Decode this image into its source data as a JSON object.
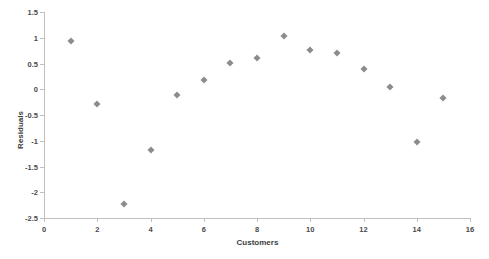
{
  "chart_data": {
    "type": "scatter",
    "title": "",
    "xlabel": "Customers",
    "ylabel": "Residuals",
    "xlim": [
      0,
      16
    ],
    "ylim": [
      -2.5,
      1.5
    ],
    "xticks": [
      "0",
      "2",
      "4",
      "6",
      "8",
      "10",
      "12",
      "14",
      "16"
    ],
    "yticks": [
      "1.5",
      "1",
      "0.5",
      "0",
      "-0.5",
      "-1",
      "-1.5",
      "-2",
      "-2.5"
    ],
    "grid": false,
    "legend": false,
    "marker_color": "#8c8c8c",
    "marker_shape": "diamond",
    "x": [
      1,
      2,
      3,
      4,
      5,
      6,
      7,
      8,
      9,
      10,
      11,
      12,
      13,
      14,
      15
    ],
    "y": [
      0.94,
      -0.28,
      -2.23,
      -1.18,
      -0.12,
      0.17,
      0.51,
      0.61,
      1.04,
      0.76,
      0.71,
      0.39,
      0.04,
      -1.02,
      -0.17
    ],
    "series": [
      {
        "name": "Residuals",
        "points": [
          {
            "x": 1,
            "y": 0.94
          },
          {
            "x": 2,
            "y": -0.28
          },
          {
            "x": 3,
            "y": -2.23
          },
          {
            "x": 4,
            "y": -1.18
          },
          {
            "x": 5,
            "y": -0.12
          },
          {
            "x": 6,
            "y": 0.17
          },
          {
            "x": 7,
            "y": 0.51
          },
          {
            "x": 8,
            "y": 0.61
          },
          {
            "x": 9,
            "y": 1.04
          },
          {
            "x": 10,
            "y": 0.76
          },
          {
            "x": 11,
            "y": 0.71
          },
          {
            "x": 12,
            "y": 0.39
          },
          {
            "x": 13,
            "y": 0.04
          },
          {
            "x": 14,
            "y": -1.02
          },
          {
            "x": 15,
            "y": -0.17
          }
        ]
      }
    ]
  }
}
